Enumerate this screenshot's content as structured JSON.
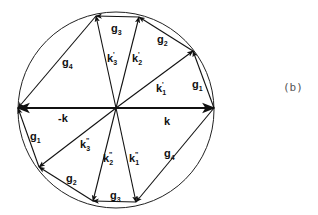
{
  "figure": {
    "tag": "(b)",
    "center": [
      116,
      108
    ],
    "circle": {
      "cx": 116,
      "cy": 110,
      "r": 98
    },
    "points": {
      "O": [
        116,
        108
      ],
      "P_right": [
        214,
        108
      ],
      "P_left": [
        18,
        108
      ],
      "U1": [
        193,
        51
      ],
      "U2": [
        139,
        17
      ],
      "U3": [
        96,
        16
      ],
      "L1": [
        136,
        202
      ],
      "L2": [
        93,
        201
      ],
      "L3": [
        39,
        167
      ]
    },
    "vectors": [
      {
        "name": "k",
        "label": "k",
        "from": "O",
        "to": "P_right",
        "bold": true,
        "lx": 164,
        "ly": 125
      },
      {
        "name": "-k",
        "label": "-k",
        "from": "O",
        "to": "P_left",
        "bold": true,
        "lx": 58,
        "ly": 122
      },
      {
        "name": "k1'",
        "label": "k",
        "sub": "1",
        "prime": "'",
        "from": "O",
        "to": "U1",
        "lx": 156,
        "ly": 92
      },
      {
        "name": "k2'",
        "label": "k",
        "sub": "2",
        "prime": "'",
        "from": "O",
        "to": "U2",
        "lx": 132,
        "ly": 62
      },
      {
        "name": "k3'",
        "label": "k",
        "sub": "3",
        "prime": "'",
        "from": "O",
        "to": "U3",
        "lx": 107,
        "ly": 62
      },
      {
        "name": "k1''",
        "label": "k",
        "sub": "1",
        "prime": "\"",
        "from": "O",
        "to": "L1",
        "lx": 129,
        "ly": 162
      },
      {
        "name": "k2''",
        "label": "k",
        "sub": "2",
        "prime": "\"",
        "from": "O",
        "to": "L2",
        "lx": 103,
        "ly": 162
      },
      {
        "name": "k3''",
        "label": "k",
        "sub": "3",
        "prime": "\"",
        "from": "O",
        "to": "L3",
        "lx": 80,
        "ly": 148
      },
      {
        "name": "g1-upper",
        "label": "g",
        "sub": "1",
        "from": "P_right",
        "to": "U1",
        "lx": 192,
        "ly": 88
      },
      {
        "name": "g2-upper",
        "label": "g",
        "sub": "2",
        "from": "U1",
        "to": "U2",
        "lx": 157,
        "ly": 43
      },
      {
        "name": "g3-upper",
        "label": "g",
        "sub": "3",
        "from": "U2",
        "to": "U3",
        "lx": 111,
        "ly": 32
      },
      {
        "name": "g4-upper",
        "label": "g",
        "sub": "4",
        "from": "U3",
        "to": "P_left",
        "lx": 62,
        "ly": 66
      },
      {
        "name": "g1-lower",
        "label": "g",
        "sub": "1",
        "from": "L3",
        "to": "P_left",
        "lx": 30,
        "ly": 140
      },
      {
        "name": "g2-lower",
        "label": "g",
        "sub": "2",
        "from": "L2",
        "to": "L3",
        "lx": 66,
        "ly": 182
      },
      {
        "name": "g3-lower",
        "label": "g",
        "sub": "3",
        "from": "L1",
        "to": "L2",
        "lx": 110,
        "ly": 199
      },
      {
        "name": "g4-lower",
        "label": "g",
        "sub": "4",
        "from": "P_right",
        "to": "L1",
        "lx": 164,
        "ly": 157
      }
    ]
  }
}
